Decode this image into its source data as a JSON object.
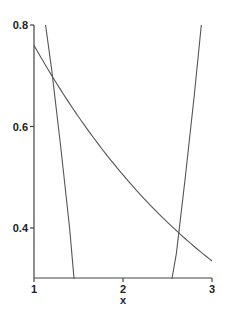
{
  "chart_data": {
    "type": "line",
    "title": "",
    "xlabel": "x",
    "ylabel": "",
    "xlim": [
      1,
      3
    ],
    "ylim": [
      0.3,
      0.8
    ],
    "grid": false,
    "legend": null,
    "x_ticks": [
      {
        "value": 1,
        "label": "1"
      },
      {
        "value": 2,
        "label": "2"
      },
      {
        "value": 3,
        "label": "3"
      }
    ],
    "y_ticks": [
      {
        "value": 0.4,
        "label": "0.4"
      },
      {
        "value": 0.6,
        "label": "0.6"
      },
      {
        "value": 0.8,
        "label": "0.8"
      }
    ],
    "series": [
      {
        "name": "decreasing-curve",
        "x": [
          1.0,
          1.25,
          1.5,
          1.75,
          2.0,
          2.25,
          2.5,
          2.75,
          3.0
        ],
        "y": [
          0.76,
          0.69,
          0.625,
          0.565,
          0.51,
          0.46,
          0.415,
          0.37,
          0.335
        ]
      },
      {
        "name": "steep-left-line",
        "x": [
          1.13,
          1.2,
          1.3,
          1.4,
          1.45
        ],
        "y": [
          0.8,
          0.71,
          0.56,
          0.4,
          0.3
        ]
      },
      {
        "name": "steep-right-line",
        "x": [
          2.55,
          2.6,
          2.7,
          2.8,
          2.88
        ],
        "y": [
          0.3,
          0.35,
          0.5,
          0.66,
          0.8
        ]
      }
    ]
  }
}
